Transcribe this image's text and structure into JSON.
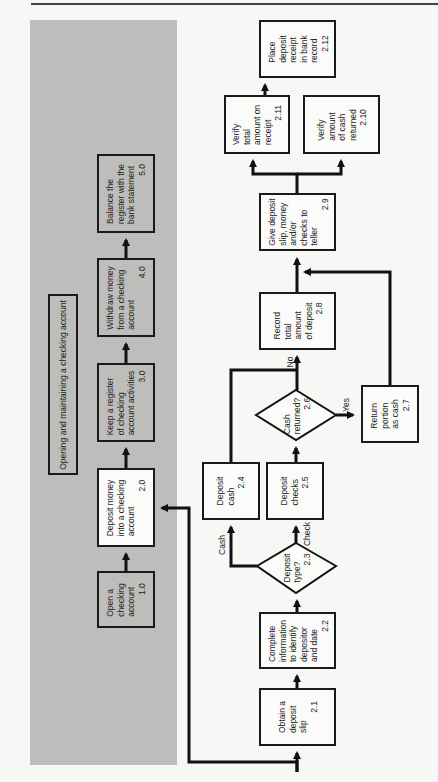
{
  "header": {
    "running_title": "... THE CHECKING ACCOUNT UNIT"
  },
  "overview": {
    "title": "Opening and maintaining a checking account",
    "steps": [
      {
        "id": "1.0",
        "text": "Open a\nchecking\naccount",
        "num": "1.0"
      },
      {
        "id": "2.0",
        "text": "Deposit money\ninto a checking\naccount",
        "num": "2.0"
      },
      {
        "id": "3.0",
        "text": "Keep a register\nof checking\naccount activities",
        "num": "3.0"
      },
      {
        "id": "4.0",
        "text": "Withdraw money\nfrom a checking\naccount",
        "num": "4.0"
      },
      {
        "id": "5.0",
        "text": "Balance the\nregister with the\nbank statement",
        "num": "5.0"
      }
    ]
  },
  "detail": {
    "steps": {
      "s21": {
        "text": "Obtain a\ndeposit\nslip",
        "num": "2.1"
      },
      "s22": {
        "text": "Complete\ninformation\nto identify\ndepositor\nand date",
        "num": "2.2"
      },
      "s23": {
        "text": "Deposit\ntype?",
        "num": "2.3"
      },
      "s24": {
        "text": "Deposit\ncash",
        "num": "2.4"
      },
      "s25": {
        "text": "Deposit\nchecks",
        "num": "2.5"
      },
      "s26": {
        "text": "Cash\nreturned?",
        "num": "2.6"
      },
      "s27": {
        "text": "Return\nportion\nas cash",
        "num": "2.7"
      },
      "s28": {
        "text": "Record\ntotal\namount\nof deposit",
        "num": "2.8"
      },
      "s29": {
        "text": "Give deposit\nslip, money\nand/or\nchecks to\nteller",
        "num": "2.9"
      },
      "s210": {
        "text": "Verify\namount\nof cash\nreturned",
        "num": "2.10"
      },
      "s211": {
        "text": "Verify\ntotal\namount on\nreceipt",
        "num": "2.11"
      },
      "s212": {
        "text": "Place\ndeposit\nreceipt\nin bank\nrecord",
        "num": "2.12"
      }
    },
    "edge_labels": {
      "cash": "Cash",
      "check": "Check",
      "no": "No",
      "yes": "Yes"
    }
  }
}
